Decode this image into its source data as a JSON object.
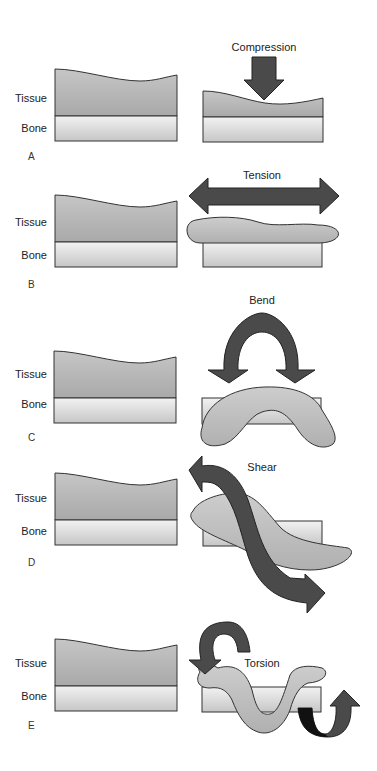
{
  "figure": {
    "labels": {
      "tissue": "Tissue",
      "bone": "Bone"
    },
    "panels": [
      {
        "letter": "A",
        "force": "Compression"
      },
      {
        "letter": "B",
        "force": "Tension"
      },
      {
        "letter": "C",
        "force": "Bend"
      },
      {
        "letter": "D",
        "force": "Shear"
      },
      {
        "letter": "E",
        "force": "Torsion"
      }
    ],
    "colors": {
      "tissue_top": "#a8a8a8",
      "tissue_bottom": "#c8c8c8",
      "bone_top": "#f0f0f0",
      "bone_bottom": "#c4c4c4",
      "deformed_tissue": "#b8b8b8",
      "arrow": "#4a4a4a",
      "arrow_dark": "#111111",
      "outline": "#333333"
    }
  }
}
